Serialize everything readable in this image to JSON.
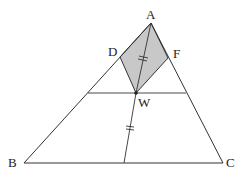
{
  "diagram": {
    "title": "",
    "colors": {
      "stroke": "#333333",
      "shade": "#c8c8c8",
      "background": "#ffffff"
    },
    "points": {
      "A": {
        "label": "A",
        "x": 151,
        "y": 23
      },
      "B": {
        "label": "B",
        "x": 24,
        "y": 163
      },
      "C": {
        "label": "C",
        "x": 223,
        "y": 163
      },
      "D": {
        "label": "D",
        "x": 120,
        "y": 57
      },
      "F": {
        "label": "F",
        "x": 168,
        "y": 58
      },
      "W": {
        "label": "W",
        "x": 136,
        "y": 93
      }
    },
    "shaded_region": "ADWF",
    "segments": [
      "AB",
      "AC",
      "BC",
      "AW",
      "WD",
      "WF",
      "DF-parallel-line-through-W",
      "W-to-BC"
    ],
    "equal_marks": {
      "AW": "=",
      "W-to-BC": "="
    }
  }
}
